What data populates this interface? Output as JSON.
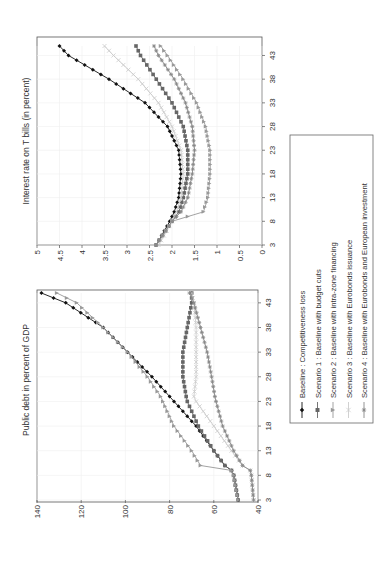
{
  "chart_data": [
    {
      "type": "line",
      "title": "Interest rate on T bills (in percent)",
      "xlabel": "",
      "ylabel": "",
      "x_ticks": [
        3,
        8,
        13,
        18,
        23,
        28,
        33,
        38,
        43
      ],
      "y_ticks": [
        "0",
        "0.5",
        "1",
        "1.5",
        "2",
        "2.5",
        "3",
        "3.5",
        "4",
        "4.5",
        "5"
      ],
      "ylim": [
        0,
        5
      ],
      "xlim": [
        3,
        45
      ],
      "grid": true,
      "orientation": "rotated 90 degrees counterclockwise",
      "x": [
        3,
        8,
        10,
        13,
        18,
        23,
        28,
        33,
        38,
        43,
        45
      ],
      "series": [
        {
          "name": "Baseline : Competitiveness loss",
          "values": [
            2.35,
            2.05,
            1.95,
            1.85,
            1.8,
            1.85,
            2.1,
            2.6,
            3.4,
            4.3,
            4.5
          ]
        },
        {
          "name": "Scenario 1 : Baseline with budget cuts",
          "values": [
            2.35,
            2.0,
            1.85,
            1.75,
            1.65,
            1.65,
            1.75,
            2.0,
            2.35,
            2.7,
            2.8
          ]
        },
        {
          "name": "Scenario 2 : Baseline with intra-zone financing",
          "values": [
            2.35,
            2.0,
            1.3,
            1.2,
            1.15,
            1.15,
            1.25,
            1.45,
            1.75,
            2.1,
            2.25
          ]
        },
        {
          "name": "Scenario 3 : Baseline with Eurobonds issuance",
          "values": [
            2.3,
            2.0,
            1.9,
            1.8,
            1.75,
            1.8,
            2.0,
            2.3,
            2.75,
            3.3,
            3.5
          ]
        },
        {
          "name": "Scenario 4 : Baseline with Eurobonds and European investment",
          "values": [
            2.35,
            2.0,
            1.8,
            1.65,
            1.55,
            1.5,
            1.55,
            1.7,
            1.95,
            2.3,
            2.4
          ]
        }
      ]
    },
    {
      "type": "line",
      "title": "Public debt in percent of GDP",
      "xlabel": "",
      "ylabel": "",
      "x_ticks": [
        3,
        8,
        13,
        18,
        23,
        28,
        33,
        38,
        43
      ],
      "y_ticks": [
        "40",
        "60",
        "80",
        "100",
        "120",
        "140"
      ],
      "ylim": [
        40,
        140
      ],
      "xlim": [
        3,
        45
      ],
      "grid": true,
      "orientation": "rotated 90 degrees counterclockwise",
      "x": [
        3,
        8,
        9,
        10,
        13,
        18,
        23,
        24,
        28,
        33,
        38,
        43,
        45
      ],
      "series": [
        {
          "name": "Baseline : Competitiveness loss",
          "values": [
            49,
            51,
            52,
            55,
            60,
            68,
            78,
            80,
            88,
            99,
            110,
            127,
            138
          ]
        },
        {
          "name": "Scenario 1 : Baseline with budget cuts",
          "values": [
            49,
            51,
            52,
            55,
            60,
            67,
            72,
            72.5,
            74,
            74,
            72,
            70,
            70
          ]
        },
        {
          "name": "Scenario 2 : Baseline with intra-zone financing",
          "values": [
            49,
            51,
            52,
            66,
            70,
            78,
            83,
            84,
            90,
            99,
            110,
            122,
            131
          ]
        },
        {
          "name": "Scenario 3 : Baseline with Eurobonds issuance",
          "values": [
            42,
            43,
            43.5,
            47,
            52,
            60,
            68,
            69,
            68,
            68,
            68,
            69,
            70
          ]
        },
        {
          "name": "Scenario 4 : Baseline with Eurobonds and European investment",
          "values": [
            42,
            43,
            43.5,
            47,
            51,
            56,
            59,
            59.5,
            61,
            63,
            66,
            69,
            71
          ]
        }
      ]
    }
  ],
  "charts": {
    "interest": {
      "title": "Interest rate on T bills (in percent)",
      "y_ticks": [
        "0",
        "0.5",
        "1",
        "1.5",
        "2",
        "2.5",
        "3",
        "3.5",
        "4",
        "4.5",
        "5"
      ],
      "x_ticks": [
        "3",
        "8",
        "13",
        "18",
        "23",
        "28",
        "33",
        "38",
        "43"
      ]
    },
    "debt": {
      "title": "Public debt in percent of GDP",
      "y_ticks": [
        "40",
        "60",
        "80",
        "100",
        "120",
        "140"
      ],
      "x_ticks": [
        "3",
        "8",
        "13",
        "18",
        "23",
        "28",
        "33",
        "38",
        "43"
      ]
    }
  },
  "legend": {
    "items": [
      {
        "label": "Baseline : Competitiveness loss",
        "color": "#111111",
        "marker": "diamond"
      },
      {
        "label": "Scenario 1 : Baseline with budget cuts",
        "color": "#666666",
        "marker": "square"
      },
      {
        "label": "Scenario 2 : Baseline with intra-zone financing",
        "color": "#999999",
        "marker": "triangle"
      },
      {
        "label": "Scenario 3 : Baseline with Eurobonds issuance",
        "color": "#cccccc",
        "marker": "x"
      },
      {
        "label": "Scenario 4 : Baseline with Eurobonds and European investment",
        "color": "#888888",
        "marker": "star"
      }
    ]
  }
}
